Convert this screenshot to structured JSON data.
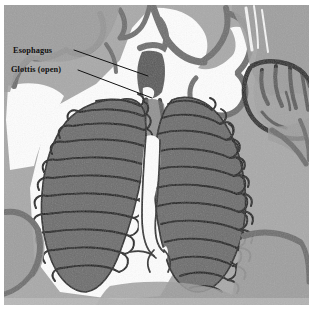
{
  "figure": {
    "width": 315,
    "height": 310,
    "background_color": "#ffffff",
    "border_color": "#ffffff"
  },
  "annotations": [
    {
      "id": "esophagus",
      "label": "Esophagus",
      "label_x": 13,
      "label_y": 47,
      "leader_from_x": 74,
      "leader_from_y": 50,
      "leader_to_x": 148,
      "leader_to_y": 76,
      "color": "#111111"
    },
    {
      "id": "glottis",
      "label": "Glottis (open)",
      "label_x": 11,
      "label_y": 66,
      "leader_from_x": 78,
      "leader_from_y": 70,
      "leader_to_x": 152,
      "leader_to_y": 98,
      "color": "#111111"
    }
  ],
  "palette": {
    "background_gray": "#a9a9a9",
    "soft_tissue_gray": "#9a9a9a",
    "lung_fill_gray": "#6d6d6d",
    "dark_outline": "#1a1a1a",
    "air_white": "#fdfdfd",
    "mid_gray": "#8a8a8a",
    "label_text": "#111111"
  },
  "anatomy": {
    "structures": [
      {
        "name": "esophagus",
        "description": "dark vertical band running through the cervical region"
      },
      {
        "name": "glottis-open",
        "description": "open glottic aperture at the top of the trachea"
      },
      {
        "name": "trachea",
        "description": "central airway descending between the lungs"
      },
      {
        "name": "left-lung",
        "description": "dark gray lobe on the left with transverse air capillary bands"
      },
      {
        "name": "right-lung",
        "description": "dark gray lobe on the right with transverse air capillary bands"
      },
      {
        "name": "mediastinum",
        "description": "white radiolucent gap between the lungs"
      },
      {
        "name": "hand-silhouette",
        "description": "restraining hand visible at upper right of the field"
      },
      {
        "name": "body-wall",
        "description": "soft tissue margins framing the thorax"
      }
    ],
    "left_lung_band_count": 11,
    "right_lung_band_count": 12
  }
}
